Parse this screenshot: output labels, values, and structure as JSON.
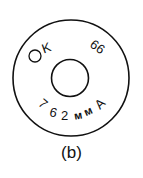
{
  "diagram": {
    "caption": "(b)",
    "marking_top_left": "K",
    "marking_top_right": "66",
    "marking_bottom": "762 мм A",
    "bottom_parts": [
      "7",
      "6",
      "2",
      "м",
      "м",
      "A"
    ],
    "stroke_color": "#111111"
  }
}
